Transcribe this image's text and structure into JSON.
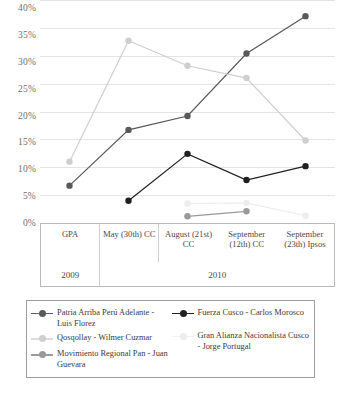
{
  "chart_data": {
    "type": "line",
    "title": "",
    "subtitle": "",
    "xlabel": "",
    "ylabel": "",
    "ylim": [
      0,
      40
    ],
    "ytick_labels": [
      "0%",
      "5%",
      "10%",
      "15%",
      "20%",
      "25%",
      "30%",
      "35%",
      "40%"
    ],
    "ytick_values": [
      0,
      5,
      10,
      15,
      20,
      25,
      30,
      35,
      40
    ],
    "grid": true,
    "legend_position": "bottom",
    "categories": [
      "GPA",
      "May (30th) CC",
      "August (21st) CC",
      "September (12th) CC",
      "September (23th) Ipsos"
    ],
    "category_groups": [
      {
        "label": "2009",
        "span": 1
      },
      {
        "label": "2010",
        "span": 4
      }
    ],
    "series": [
      {
        "name": "Patria Arriba Perú Adelante - Luis Florez",
        "color": "#595959",
        "values": [
          6.7,
          16.7,
          19.2,
          30.4,
          37.1
        ]
      },
      {
        "name": "Fuerza Cusco - Carlos Morosco",
        "color": "#1f1f1f",
        "values": [
          null,
          4.0,
          12.4,
          7.7,
          10.2
        ]
      },
      {
        "name": "Qosqollay - Wilmer Cuzmar",
        "color": "#cfcfcf",
        "values": [
          11.0,
          32.7,
          28.2,
          26.0,
          14.8
        ]
      },
      {
        "name": "Gran Alianza Nacionalista Cusco - Jorge Portugal",
        "color": "#ededed",
        "values": [
          null,
          null,
          3.5,
          3.6,
          1.3
        ]
      },
      {
        "name": "Movimiento Regional Pan - Juan Guevara",
        "color": "#9a9a9a",
        "values": [
          null,
          null,
          1.2,
          2.1,
          null
        ]
      }
    ]
  },
  "yaxis": {
    "t0": "40%",
    "t1": "35%",
    "t2": "30%",
    "t3": "25%",
    "t4": "20%",
    "t5": "15%",
    "t6": "10%",
    "t7": "5%",
    "t8": "0%"
  },
  "categories_table": {
    "c0": "GPA",
    "c1": "May (30th) CC",
    "c2": "August (21st) CC",
    "c3": "September (12th) CC",
    "c4": "September (23th) Ipsos",
    "year_left": "2009",
    "year_right": "2010"
  },
  "legend": {
    "left": [
      {
        "label": "Patria Arriba Perú Adelante - Luis Florez",
        "color": "#595959"
      },
      {
        "label": "Qosqollay - Wilmer Cuzmar",
        "color": "#cfcfcf"
      },
      {
        "label": "Movimiento Regional Pan - Juan Guevara",
        "color": "#9a9a9a"
      }
    ],
    "right": [
      {
        "label": "Fuerza Cusco - Carlos Morosco",
        "color": "#1f1f1f"
      },
      {
        "label": "Gran Alianza Nacionalista Cusco - Jorge Portugal",
        "color": "#ededed"
      }
    ],
    "l0": "Patria Arriba Perú Adelante - Luis Florez",
    "l1": "Qosqollay - Wilmer Cuzmar",
    "l2": "Movimiento Regional Pan - Juan Guevara",
    "r0": "Fuerza Cusco - Carlos Morosco",
    "r1": "Gran Alianza Nacionalista Cusco - Jorge Portugal"
  }
}
